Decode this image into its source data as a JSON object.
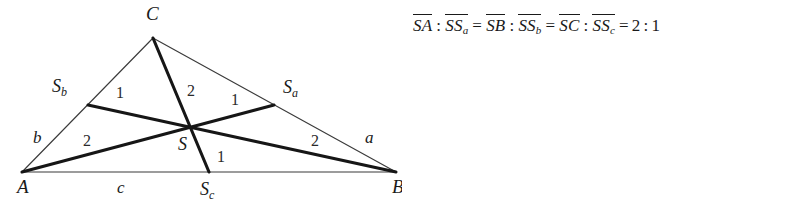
{
  "figure": {
    "caption_formula": {
      "segments": [
        {
          "type": "overline",
          "text": "SA"
        },
        {
          "type": "op",
          "text": ":"
        },
        {
          "type": "overline",
          "text": "SS",
          "sub": "a"
        },
        {
          "type": "op",
          "text": "="
        },
        {
          "type": "overline",
          "text": "SB"
        },
        {
          "type": "op",
          "text": ":"
        },
        {
          "type": "overline",
          "text": "SS",
          "sub": "b"
        },
        {
          "type": "op",
          "text": "="
        },
        {
          "type": "overline",
          "text": "SC"
        },
        {
          "type": "op",
          "text": ":"
        },
        {
          "type": "overline",
          "text": "SS",
          "sub": "c"
        },
        {
          "type": "op",
          "text": "="
        },
        {
          "type": "num",
          "text": "2"
        },
        {
          "type": "op",
          "text": ":"
        },
        {
          "type": "num",
          "text": "1"
        }
      ],
      "plain": "SA : SSa = SB : SSb = SC : SSc = 2 : 1"
    },
    "vertices": {
      "A": {
        "label": "A",
        "x": 22,
        "y": 172,
        "label_x": 17,
        "label_y": 193
      },
      "B": {
        "label": "B",
        "x": 396,
        "y": 172,
        "label_x": 392,
        "label_y": 193
      },
      "C": {
        "label": "C",
        "x": 153,
        "y": 38,
        "label_x": 146,
        "label_y": 20
      }
    },
    "midpoints": {
      "Sa": {
        "label": "S",
        "sub": "a",
        "x": 274,
        "y": 105,
        "label_x": 283,
        "label_y": 93
      },
      "Sb": {
        "label": "S",
        "sub": "b",
        "x": 88,
        "y": 105,
        "label_x": 52,
        "label_y": 92
      },
      "Sc": {
        "label": "S",
        "sub": "c",
        "x": 209,
        "y": 172,
        "label_x": 200,
        "label_y": 195
      }
    },
    "centroid": {
      "label": "S",
      "x": 190,
      "y": 127,
      "label_x": 178,
      "label_y": 150
    },
    "side_labels": [
      {
        "name": "a",
        "text": "a",
        "x": 365,
        "y": 143
      },
      {
        "name": "b",
        "text": "b",
        "x": 33,
        "y": 143
      },
      {
        "name": "c",
        "text": "c",
        "x": 117,
        "y": 193
      }
    ],
    "ratio_labels": [
      {
        "name": "ratio-cs-sb-upper",
        "text": "1",
        "x": 116,
        "y": 98
      },
      {
        "name": "ratio-cs-upper",
        "text": "2",
        "x": 187,
        "y": 96
      },
      {
        "name": "ratio-sa-upper",
        "text": "1",
        "x": 231,
        "y": 105
      },
      {
        "name": "ratio-as-lower",
        "text": "2",
        "x": 83,
        "y": 146
      },
      {
        "name": "ratio-bs-lower",
        "text": "2",
        "x": 311,
        "y": 146
      },
      {
        "name": "ratio-ssc-lower",
        "text": "1",
        "x": 217,
        "y": 162
      }
    ],
    "colors": {
      "background": "#ffffff",
      "side_stroke": "#3b3b3b",
      "median_stroke": "#161616",
      "text": "#1a1a1a"
    }
  }
}
